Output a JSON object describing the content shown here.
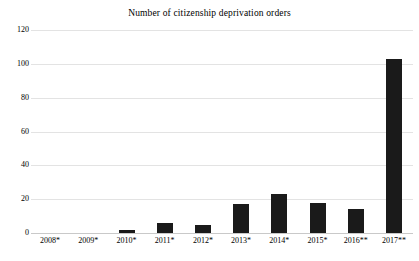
{
  "chart_data": {
    "type": "bar",
    "title": "Number of citizenship deprivation orders",
    "subtitle": "",
    "xlabel": "",
    "ylabel": "",
    "categories": [
      "2008*",
      "2009*",
      "2010*",
      "2011*",
      "2012*",
      "2013*",
      "2014*",
      "2015*",
      "2016**",
      "2017**"
    ],
    "values": [
      0,
      0,
      2,
      6,
      5,
      17,
      23,
      18,
      14,
      103
    ],
    "series": [
      {
        "name": "Deprivation orders",
        "values": [
          0,
          0,
          2,
          6,
          5,
          17,
          23,
          18,
          14,
          103
        ]
      }
    ],
    "ylim": [
      0,
      120
    ],
    "yticks": [
      0,
      20,
      40,
      60,
      80,
      100,
      120
    ],
    "ytick_labels": [
      "0",
      "20",
      "40",
      "60",
      "80",
      "100",
      "120"
    ],
    "grid": true,
    "grid_axis": "y",
    "legend": false,
    "legend_position": "none",
    "bar_color": "#1a1a1a",
    "gridline_color": "#e3e3e3",
    "axis_color": "#c9c9c9",
    "background_color": "#ffffff",
    "text_color": "#000000"
  }
}
